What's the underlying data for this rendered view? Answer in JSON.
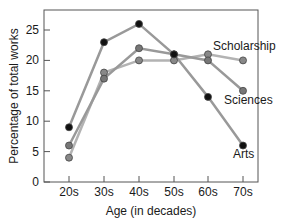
{
  "chart_data": {
    "type": "line",
    "title": "",
    "xlabel": "Age (in decades)",
    "ylabel": "Percentage of total works",
    "categories": [
      "20s",
      "30s",
      "40s",
      "50s",
      "60s",
      "70s"
    ],
    "ylim": [
      0,
      28
    ],
    "yticks": [
      0,
      5,
      10,
      15,
      20,
      25
    ],
    "grid": false,
    "legend_position": "inline labels at line ends",
    "series": [
      {
        "name": "Arts",
        "values": [
          9,
          23,
          26,
          21,
          14,
          6
        ],
        "marker_color": "#111111",
        "line_color": "#999999"
      },
      {
        "name": "Sciences",
        "values": [
          6,
          17,
          22,
          21,
          20,
          15
        ],
        "marker_color": "#777777",
        "line_color": "#999999"
      },
      {
        "name": "Scholarship",
        "values": [
          4,
          18,
          20,
          20,
          21,
          20
        ],
        "marker_color": "#888888",
        "line_color": "#b3b3b3"
      }
    ]
  },
  "labels": {
    "scholarship": "Scholarship",
    "sciences": "Sciences",
    "arts": "Arts"
  }
}
